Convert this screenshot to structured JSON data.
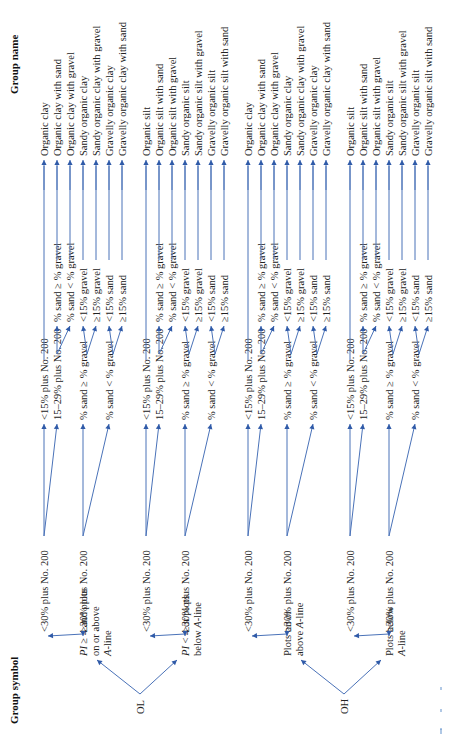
{
  "headers": {
    "group_symbol": "Group symbol",
    "group_name": "Group name"
  },
  "colors": {
    "line": "#4a72b8",
    "arrowhead": "#2f5aa8",
    "text": "#222222"
  },
  "groups": [
    {
      "symbol": "OL",
      "branches": [
        {
          "condition_lines": [
            "PI ≥ 4 and plots",
            "on or above",
            "A-line"
          ],
          "fine_label": "<30% plus No. 200",
          "fine_children": [
            {
              "label": "<15% plus No. 200",
              "leaves": [
                {
                  "name": "Organic clay"
                }
              ]
            },
            {
              "label": "15–29% plus No. 200",
              "leaves": [
                {
                  "cond": "% sand ≥ % gravel",
                  "name": "Organic clay with sand"
                },
                {
                  "cond": "% sand < % gravel",
                  "name": "Organic clay with gravel"
                }
              ]
            }
          ],
          "coarse_label": "≥30% plus No. 200",
          "coarse_children": [
            {
              "label": "% sand ≥ % gravel",
              "leaves": [
                {
                  "cond": "<15% gravel",
                  "name": "Sandy organic clay"
                },
                {
                  "cond": "≥15% gravel",
                  "name": "Sandy organic clay with gravel"
                }
              ]
            },
            {
              "label": "% sand < % gravel",
              "leaves": [
                {
                  "cond": "<15% sand",
                  "name": "Gravelly organic clay"
                },
                {
                  "cond": "≥15% sand",
                  "name": "Gravelly organic clay with sand"
                }
              ]
            }
          ]
        },
        {
          "condition_lines": [
            "PI < 4 or plots",
            "below A-line"
          ],
          "fine_label": "<30% plus No. 200",
          "fine_children": [
            {
              "label": "<15% plus No. 200",
              "leaves": [
                {
                  "name": "Organic silt"
                }
              ]
            },
            {
              "label": "15–29% plus No. 200",
              "leaves": [
                {
                  "cond": "% sand ≥ % gravel",
                  "name": "Organic silt with sand"
                },
                {
                  "cond": "% sand < % gravel",
                  "name": "Organic silt with gravel"
                }
              ]
            }
          ],
          "coarse_label": "≥30% plus No. 200",
          "coarse_children": [
            {
              "label": "% sand ≥ % gravel",
              "leaves": [
                {
                  "cond": "<15% gravel",
                  "name": "Sandy organic silt"
                },
                {
                  "cond": "≥15% gravel",
                  "name": "Sandy organic silt with gravel"
                }
              ]
            },
            {
              "label": "% sand < % gravel",
              "leaves": [
                {
                  "cond": "<15% sand",
                  "name": "Gravelly organic silt"
                },
                {
                  "cond": "≥15% sand",
                  "name": "Gravelly organic silt with sand"
                }
              ]
            }
          ]
        }
      ]
    },
    {
      "symbol": "OH",
      "branches": [
        {
          "condition_lines": [
            "Plots on or",
            "above A-line"
          ],
          "fine_label": "<30% plus No. 200",
          "fine_children": [
            {
              "label": "<15% plus No. 200",
              "leaves": [
                {
                  "name": "Organic clay"
                }
              ]
            },
            {
              "label": "15–29% plus No. 200",
              "leaves": [
                {
                  "cond": "% sand ≥ % gravel",
                  "name": "Organic clay with sand"
                },
                {
                  "cond": "% sand < % gravel",
                  "name": "Organic clay with gravel"
                }
              ]
            }
          ],
          "coarse_label": "≥30% plus No. 200",
          "coarse_children": [
            {
              "label": "% sand ≥ % gravel",
              "leaves": [
                {
                  "cond": "<15% gravel",
                  "name": "Sandy organic clay"
                },
                {
                  "cond": "≥15% gravel",
                  "name": "Sandy organic clay with gravel"
                }
              ]
            },
            {
              "label": "% sand < % gravel",
              "leaves": [
                {
                  "cond": "<15% sand",
                  "name": "Gravelly organic clay"
                },
                {
                  "cond": "≥15% sand",
                  "name": "Gravelly organic clay with sand"
                }
              ]
            }
          ]
        },
        {
          "condition_lines": [
            "Plots below",
            "A-line"
          ],
          "fine_label": "<30% plus No. 200",
          "fine_children": [
            {
              "label": "<15% plus No. 200",
              "leaves": [
                {
                  "name": "Organic silt"
                }
              ]
            },
            {
              "label": "15–29% plus No. 200",
              "leaves": [
                {
                  "cond": "% sand ≥ % gravel",
                  "name": "Organic silt with sand"
                },
                {
                  "cond": "% sand < % gravel",
                  "name": "Organic silt with gravel"
                }
              ]
            }
          ],
          "coarse_label": "≥30% plus No. 200",
          "coarse_children": [
            {
              "label": "% sand ≥ % gravel",
              "leaves": [
                {
                  "cond": "<15% gravel",
                  "name": "Sandy organic silt"
                },
                {
                  "cond": "≥15% gravel",
                  "name": "Sandy organic silt with gravel"
                }
              ]
            },
            {
              "label": "% sand < % gravel",
              "leaves": [
                {
                  "cond": "<15% sand",
                  "name": "Gravelly organic silt"
                },
                {
                  "cond": "≥15% sand",
                  "name": "Gravelly organic silt with sand"
                }
              ]
            }
          ]
        }
      ]
    }
  ]
}
